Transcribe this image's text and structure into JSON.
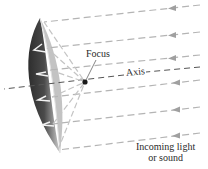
{
  "diagram": {
    "labels": {
      "focus": "Focus",
      "axis": "Axis",
      "incoming_line1": "Incoming light",
      "incoming_line2": "or sound"
    },
    "colors": {
      "dish_dark": "#3a3a3a",
      "dish_mid": "#8a8a8a",
      "dish_light": "#c8c8c8",
      "ray": "#b4b4b4",
      "reflected_ray": "#c4c4c4",
      "axis_line": "#555555",
      "focus_point": "#1a1a1a",
      "text": "#2a2a2a"
    },
    "focus_point": {
      "x": 85,
      "y": 82
    },
    "incoming_rays": [
      {
        "y_right": 5,
        "y_left": 22
      },
      {
        "y_right": 32,
        "y_left": 48
      },
      {
        "y_right": 55,
        "y_left": 70
      },
      {
        "y_right": 80,
        "y_left": 97
      },
      {
        "y_right": 107,
        "y_left": 124
      },
      {
        "y_right": 133,
        "y_left": 150
      }
    ],
    "axis": {
      "y_right": 67,
      "y_left": 89
    }
  }
}
